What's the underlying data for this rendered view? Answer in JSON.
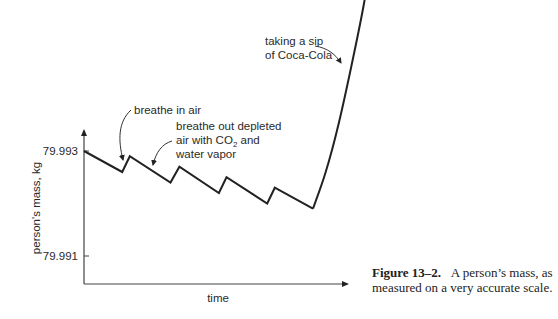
{
  "chart_data": {
    "type": "line",
    "title": "",
    "xlabel": "time",
    "ylabel": "person's mass, kg",
    "yticks": [
      "79.993",
      "79.991"
    ],
    "ytick_values": [
      79.993,
      79.991
    ],
    "ylim": [
      79.9904,
      79.9975
    ],
    "grid": false,
    "series": [
      {
        "name": "person's mass",
        "x": [
          0,
          1.5,
          1.8,
          3.4,
          3.75,
          5.3,
          5.6,
          7.2,
          7.5,
          9.0
        ],
        "y": [
          79.993,
          79.9926,
          79.9929,
          79.9924,
          79.9927,
          79.9922,
          79.9925,
          79.992,
          79.9923,
          79.9919
        ]
      },
      {
        "name": "after sip",
        "x": [
          9.0,
          9.5,
          10.0,
          10.5,
          11.0,
          11.4
        ],
        "y": [
          79.9919,
          79.9926,
          79.9935,
          79.9946,
          79.9958,
          79.997
        ]
      }
    ],
    "annotations": [
      {
        "text": "breathe in air",
        "lines": [
          "breathe in air"
        ]
      },
      {
        "text": "breathe out depleted air with CO2 and water vapor",
        "lines": [
          "breathe out depleted",
          "air with CO",
          "2",
          " and",
          "water vapor"
        ]
      },
      {
        "text": "taking a sip of Coca-Cola",
        "lines": [
          "taking a sip",
          "of Coca-Cola"
        ]
      }
    ]
  },
  "caption": {
    "label": "Figure 13–2.",
    "text": "A person’s mass, as measured on a very accurate scale."
  }
}
